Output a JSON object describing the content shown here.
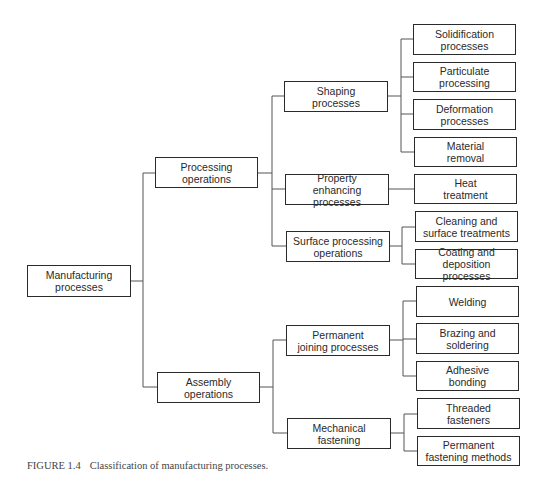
{
  "diagram": {
    "type": "hierarchy-tree",
    "root": {
      "label": "Manufacturing\nprocesses",
      "children": [
        {
          "label": "Processing\noperations",
          "children": [
            {
              "label": "Shaping\nprocesses",
              "children": [
                {
                  "label": "Solidification\nprocesses"
                },
                {
                  "label": "Particulate\nprocessing"
                },
                {
                  "label": "Deformation\nprocesses"
                },
                {
                  "label": "Material\nremoval"
                }
              ]
            },
            {
              "label": "Property\nenhancing processes",
              "children": [
                {
                  "label": "Heat\ntreatment"
                }
              ]
            },
            {
              "label": "Surface processing\noperations",
              "children": [
                {
                  "label": "Cleaning and\nsurface treatments"
                },
                {
                  "label": "Coating and\ndeposition processes"
                }
              ]
            }
          ]
        },
        {
          "label": "Assembly\noperations",
          "children": [
            {
              "label": "Permanent\njoining processes",
              "children": [
                {
                  "label": "Welding"
                },
                {
                  "label": "Brazing and\nsoldering"
                },
                {
                  "label": "Adhesive\nbonding"
                }
              ]
            },
            {
              "label": "Mechanical\nfastening",
              "children": [
                {
                  "label": "Threaded\nfasteners"
                },
                {
                  "label": "Permanent\nfastening methods"
                }
              ]
            }
          ]
        }
      ]
    }
  },
  "nodes": {
    "manufacturing": "Manufacturing\nprocesses",
    "processing": "Processing\noperations",
    "assembly": "Assembly\noperations",
    "shaping": "Shaping\nprocesses",
    "property": "Property\nenhancing processes",
    "surface": "Surface processing\noperations",
    "permanent_joining": "Permanent\njoining processes",
    "mechanical": "Mechanical\nfastening",
    "solidification": "Solidification\nprocesses",
    "particulate": "Particulate\nprocessing",
    "deformation": "Deformation\nprocesses",
    "material_removal": "Material\nremoval",
    "heat_treatment": "Heat\ntreatment",
    "cleaning": "Cleaning and\nsurface treatments",
    "coating": "Coating and\ndeposition processes",
    "welding": "Welding",
    "brazing": "Brazing and\nsoldering",
    "adhesive": "Adhesive\nbonding",
    "threaded": "Threaded\nfasteners",
    "permanent_fastening": "Permanent\nfastening methods"
  },
  "caption": {
    "figure_number": "FIGURE 1.4",
    "text": "Classification of manufacturing processes."
  },
  "colors": {
    "box_border": "#2a2a2a",
    "connector": "#555555",
    "text": "#2a2a2a",
    "caption": "#444444",
    "background": "#ffffff"
  }
}
